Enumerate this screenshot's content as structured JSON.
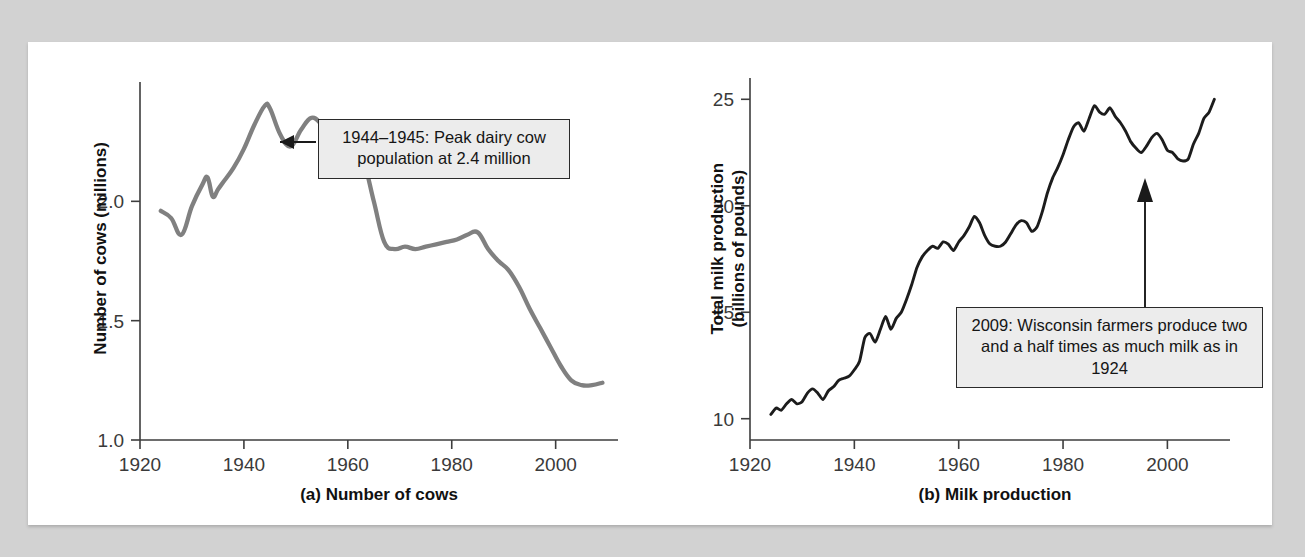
{
  "page": {
    "background_color": "#d2d2d2",
    "panel_color": "#ffffff"
  },
  "charts": [
    {
      "id": "a",
      "caption": "(a) Number of cows",
      "ylabel": "Number of cows (millions)",
      "line_color": "#808080",
      "callout": "1944–1945: Peak dairy cow population at 2.4 million"
    },
    {
      "id": "b",
      "caption": "(b) Milk production",
      "ylabel": "Total milk production\n(billions of pounds)",
      "line_color": "#1c1c1c",
      "callout": "2009: Wisconsin farmers produce two and a half times as much milk as in 1924"
    }
  ],
  "chart_data": [
    {
      "type": "line",
      "title": "(a) Number of cows",
      "xlabel": "",
      "ylabel": "Number of cows (millions)",
      "xlim": [
        1920,
        2012
      ],
      "ylim": [
        1.0,
        2.5
      ],
      "xticks": [
        1920,
        1940,
        1960,
        1980,
        2000
      ],
      "yticks": [
        1.0,
        1.5,
        2.0
      ],
      "grid": false,
      "legend": "none",
      "line_color": "#808080",
      "annotations": [
        {
          "text": "1944–1945: Peak dairy cow population at 2.4 million",
          "points_to_year": 1945,
          "points_to_value": 2.4
        }
      ],
      "x": [
        1924,
        1926,
        1928,
        1930,
        1932,
        1933,
        1934,
        1935,
        1936,
        1938,
        1940,
        1942,
        1944,
        1945,
        1947,
        1949,
        1951,
        1953,
        1955,
        1957,
        1959,
        1961,
        1963,
        1965,
        1967,
        1969,
        1971,
        1973,
        1975,
        1977,
        1979,
        1981,
        1983,
        1985,
        1987,
        1989,
        1991,
        1993,
        1995,
        1997,
        1999,
        2001,
        2003,
        2005,
        2007,
        2009
      ],
      "y": [
        1.96,
        1.93,
        1.86,
        1.98,
        2.07,
        2.1,
        2.02,
        2.05,
        2.08,
        2.14,
        2.22,
        2.32,
        2.4,
        2.39,
        2.28,
        2.23,
        2.3,
        2.35,
        2.32,
        2.26,
        2.24,
        2.23,
        2.17,
        2.0,
        1.83,
        1.8,
        1.81,
        1.8,
        1.81,
        1.82,
        1.83,
        1.84,
        1.86,
        1.87,
        1.8,
        1.75,
        1.71,
        1.64,
        1.55,
        1.47,
        1.39,
        1.31,
        1.25,
        1.23,
        1.23,
        1.24
      ]
    },
    {
      "type": "line",
      "title": "(b) Milk production",
      "xlabel": "",
      "ylabel": "Total milk production (billions of pounds)",
      "xlim": [
        1920,
        2012
      ],
      "ylim": [
        9,
        26
      ],
      "xticks": [
        1920,
        1940,
        1960,
        1980,
        2000
      ],
      "yticks": [
        10,
        15,
        20,
        25
      ],
      "grid": false,
      "legend": "none",
      "line_color": "#1c1c1c",
      "annotations": [
        {
          "text": "2009: Wisconsin farmers produce two and a half times as much milk as in 1924",
          "points_to_year": 2009,
          "points_to_value": 25.0
        }
      ],
      "x": [
        1924,
        1925,
        1926,
        1927,
        1928,
        1929,
        1930,
        1931,
        1932,
        1933,
        1934,
        1935,
        1936,
        1937,
        1938,
        1939,
        1940,
        1941,
        1942,
        1943,
        1944,
        1945,
        1946,
        1947,
        1948,
        1949,
        1950,
        1951,
        1952,
        1953,
        1954,
        1955,
        1956,
        1957,
        1958,
        1959,
        1960,
        1961,
        1962,
        1963,
        1964,
        1965,
        1966,
        1967,
        1968,
        1969,
        1970,
        1971,
        1972,
        1973,
        1974,
        1975,
        1976,
        1977,
        1978,
        1979,
        1980,
        1981,
        1982,
        1983,
        1984,
        1985,
        1986,
        1987,
        1988,
        1989,
        1990,
        1991,
        1992,
        1993,
        1994,
        1995,
        1996,
        1997,
        1998,
        1999,
        2000,
        2001,
        2002,
        2003,
        2004,
        2005,
        2006,
        2007,
        2008,
        2009
      ],
      "y": [
        10.2,
        10.5,
        10.4,
        10.7,
        10.9,
        10.7,
        10.8,
        11.2,
        11.4,
        11.2,
        10.9,
        11.3,
        11.5,
        11.8,
        11.9,
        12.0,
        12.3,
        12.7,
        13.8,
        14.0,
        13.6,
        14.2,
        14.8,
        14.2,
        14.7,
        15.0,
        15.6,
        16.3,
        17.1,
        17.6,
        17.9,
        18.1,
        18.0,
        18.3,
        18.2,
        17.9,
        18.3,
        18.6,
        19.0,
        19.5,
        19.2,
        18.6,
        18.2,
        18.1,
        18.1,
        18.3,
        18.7,
        19.1,
        19.3,
        19.2,
        18.8,
        19.0,
        19.7,
        20.6,
        21.3,
        21.8,
        22.4,
        23.1,
        23.7,
        23.9,
        23.5,
        24.1,
        24.7,
        24.4,
        24.3,
        24.6,
        24.2,
        23.9,
        23.5,
        23.0,
        22.7,
        22.5,
        22.8,
        23.2,
        23.4,
        23.1,
        22.6,
        22.5,
        22.2,
        22.1,
        22.2,
        22.9,
        23.4,
        24.1,
        24.4,
        25.0
      ]
    }
  ]
}
